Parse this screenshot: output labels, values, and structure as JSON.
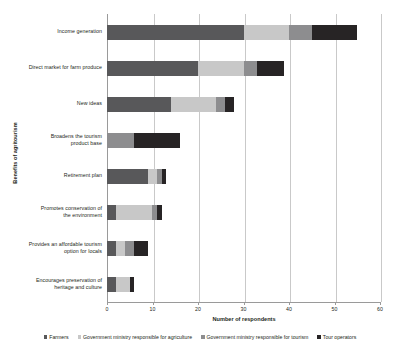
{
  "chart_data": {
    "type": "bar",
    "orientation": "horizontal",
    "stacked": true,
    "title": "",
    "xlabel": "Number of respondents",
    "ylabel": "Benefits of agritourism",
    "xlim": [
      0,
      60
    ],
    "xticks": [
      0,
      10,
      20,
      30,
      40,
      50,
      60
    ],
    "grid": "vertical",
    "legend_position": "bottom",
    "categories": [
      "Income generation",
      "Direct market for farm produce",
      "New ideas",
      "Broadens the tourism product base",
      "Retirement plan",
      "Promotes conservation of the environment",
      "Provides an affordable tourism option for locals",
      "Encourages preservation of heritage and culture"
    ],
    "series": [
      {
        "name": "Farmers",
        "color": "#58585a",
        "values": [
          30,
          20,
          14,
          0,
          9,
          2,
          2,
          2
        ]
      },
      {
        "name": "Government ministry responsible for agriculture",
        "color": "#c8c8c8",
        "values": [
          10,
          10,
          10,
          0,
          2,
          8,
          2,
          3
        ]
      },
      {
        "name": "Government ministry responsible for tourism",
        "color": "#8d8d8f",
        "values": [
          5,
          3,
          2,
          6,
          1,
          1,
          2,
          0
        ]
      },
      {
        "name": "Tour operators",
        "color": "#272425",
        "values": [
          10,
          6,
          2,
          10,
          1,
          1,
          3,
          1
        ]
      }
    ],
    "totals": [
      55,
      39,
      28,
      16,
      13,
      12,
      9,
      6
    ]
  },
  "axis": {
    "x_title": "Number of respondents",
    "y_title": "Benefits of agritourism",
    "tick_labels": [
      "0",
      "10",
      "20",
      "30",
      "40",
      "50",
      "60"
    ]
  },
  "category_lines": [
    [
      "Income generation"
    ],
    [
      "Direct market for farm produce"
    ],
    [
      "New ideas"
    ],
    [
      "Broadens the tourism",
      "product base"
    ],
    [
      "Retirement plan"
    ],
    [
      "Promotes conservation of",
      "the environment"
    ],
    [
      "Provides an affordable tourism",
      "option for locals"
    ],
    [
      "Encourages preservation of",
      "heritage and culture"
    ]
  ],
  "legend": {
    "items": [
      {
        "label": "Farmers",
        "color": "#58585a"
      },
      {
        "label": "Government ministry responsible for agriculture",
        "color": "#c8c8c8"
      },
      {
        "label": "Government ministry responsible for tourism",
        "color": "#8d8d8f"
      },
      {
        "label": "Tour operators",
        "color": "#272425"
      }
    ]
  },
  "colors": {
    "grid": "#c9c9c9",
    "axis": "#9a9a9a",
    "text": "#231f20",
    "background": "#ffffff"
  }
}
